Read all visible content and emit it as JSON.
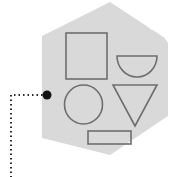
{
  "canvas": {
    "width": 189,
    "height": 177,
    "background_color": "#ffffff",
    "title": "Hexagon tile with geometric shape outlines and annotation leader line"
  },
  "colors": {
    "hexagon_fill": "#d9d9d9",
    "hexagon_stroke": "none",
    "shape_stroke": "#6e6e6e",
    "shape_fill": "none",
    "stripe_color": "#ffffff",
    "marker_color": "#111111",
    "leader_line_color": "#2b2b2b"
  },
  "hexagon": {
    "name": "hexagon-tile",
    "points": "110,2 168,40 168,116 110,155 42,138 42,36",
    "fill": "#d9d9d9"
  },
  "stripes": [
    {
      "name": "stripe-1",
      "points": "124,0 189,0 189,7 132,7"
    },
    {
      "name": "stripe-2",
      "points": "141,11 189,11 189,18 150,18"
    },
    {
      "name": "stripe-3",
      "points": "160,24 189,24 189,31 168,31"
    },
    {
      "name": "stripe-diagonal-1",
      "d": "M 122 4 L 189 -12 L 189 -4 L 132 14 Z"
    },
    {
      "name": "stripe-diagonal-2",
      "d": "M 141 20 L 189 4 L 189 13 L 151 30 Z"
    },
    {
      "name": "stripe-diagonal-3",
      "d": "M 160 36 L 189 24 L 189 33 L 170 46 Z"
    },
    {
      "name": "stripe-diagonal-4",
      "d": "M 168 60 L 189 44 L 189 54 L 168 70 Z"
    }
  ],
  "shapes": [
    {
      "name": "square-outline",
      "type": "rect",
      "x": 66,
      "y": 33,
      "width": 41,
      "height": 46,
      "stroke": "#6e6e6e"
    },
    {
      "name": "semicircle-outline",
      "type": "semicircle",
      "cx": 137,
      "cy": 56,
      "radius": 20,
      "orientation": "flat-top",
      "stroke": "#6e6e6e"
    },
    {
      "name": "circle-outline",
      "type": "ellipse",
      "cx": 83.5,
      "cy": 104.5,
      "rx": 19,
      "ry": 19.5,
      "stroke": "#6e6e6e"
    },
    {
      "name": "triangle-outline",
      "type": "triangle",
      "points": "113,85 157,85 135,126",
      "orientation": "point-down",
      "stroke": "#6e6e6e"
    },
    {
      "name": "rectangle-outline",
      "type": "rect",
      "x": 88,
      "y": 131,
      "width": 43,
      "height": 13,
      "stroke": "#6e6e6e"
    }
  ],
  "annotation": {
    "marker": {
      "name": "annotation-point-marker",
      "cx": 47,
      "cy": 95,
      "radius": 4.5,
      "color": "#111111"
    },
    "leader_line": {
      "name": "annotation-leader-line",
      "path": "M 47 95 L 11 95 L 11 177",
      "style": "dotted",
      "dash_array": "1.5 3",
      "width": 2,
      "color": "#2b2b2b"
    }
  }
}
